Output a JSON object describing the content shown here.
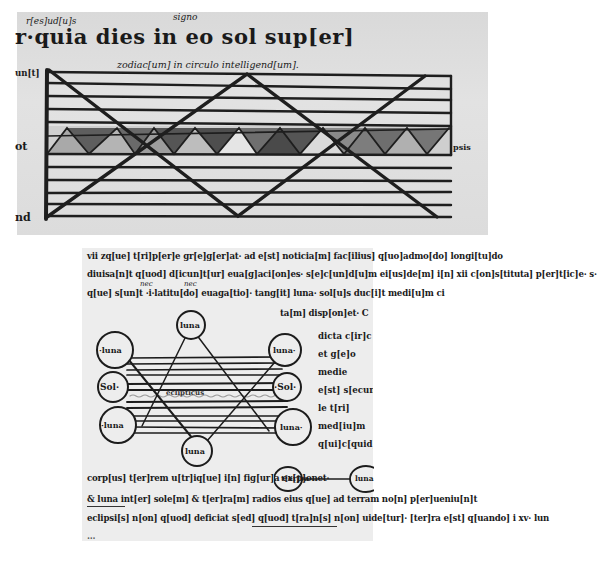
{
  "figure_top": {
    "description": "Rectangular eclipse diagram: horizontal ruled bands with a shaded zigzag (ecliptic) band and two crossing diagonal paths",
    "gloss_left": "r[es]ud[u]s",
    "gloss_signo": "signo",
    "heading": "r·quia dies in eo sol sup[er]",
    "subheading": "zodiac[um] in circulo intelligend[um].",
    "margin_left_top": "un[t]",
    "margin_left_mid": "ot",
    "margin_left_bottom": "nd",
    "margin_right_mid": "eclipsis",
    "colors": {
      "parchment": "#dcdcdc",
      "ink": "#1c1c1c",
      "shade_dark": "#5a5a5a",
      "shade_light": "#a8a8a8"
    }
  },
  "figure_bottom": {
    "description": "Circular diagram of sun and moon positions with crossing lunar paths",
    "text_lines_top": [
      "vii zq[ue] t[ri]p[er]e gr[e]g[er]at· ad e[st] noticia[m] fac[ilius] q[uo]admo[do] longi[tu]do",
      "diuisa[n]t q[uod] d[icun]t[ur] eua[g]aci[on]es· s[e]c[un]d[u]m ei[us]de[m] i[n] xii c[on]s[tituta] p[er]t[ic]e· s·",
      "q[ue] s[un]t ·i·latitu[do] euaga[tio]· tang[it] luna· sol[u]s duc[i]t medi[u]m ci",
      "ta[m] disp[on]et· C"
    ],
    "gloss_nec_1": "nec",
    "gloss_nec_2": "nec",
    "circles": [
      {
        "label": "luna",
        "position": "top"
      },
      {
        "label": "·luna",
        "position": "upper-left"
      },
      {
        "label": "luna·",
        "position": "upper-right"
      },
      {
        "label": "Sol·",
        "position": "middle-left"
      },
      {
        "label": "·Sol·",
        "position": "middle-right"
      },
      {
        "label": "·luna",
        "position": "lower-left"
      },
      {
        "label": "luna·",
        "position": "lower-right"
      },
      {
        "label": "luna",
        "position": "bottom"
      }
    ],
    "center_band_label": "eclipticus",
    "right_column": [
      "dicta c[ir]c",
      "et g[e]o",
      "medie",
      "e[st] s[ecun]d[u]m",
      "le t[ri]",
      "med[iu]m",
      "q[ui]c[quid]: n"
    ],
    "text_lines_bottom": [
      "corp[us] t[er]rem u[tr]iq[ue] i[n] fig[ur]a ex[p]onet·",
      "& luna int[er] sole[m] & t[er]ra[m] radios eius q[ue] ad terram no[n] p[er]ueniu[n]t",
      "eclipsi[s] n[on] q[uod] deficiat s[ed] q[uod] t[ra]n[s] n[on] uide[tur]· [ter]ra e[st] q[uando] i xv· lun",
      "..."
    ],
    "inline_circles": [
      {
        "label": "t[er]ra"
      },
      {
        "label": "luna"
      }
    ],
    "colors": {
      "parchment": "#ededed",
      "ink": "#1a1a1a"
    }
  }
}
